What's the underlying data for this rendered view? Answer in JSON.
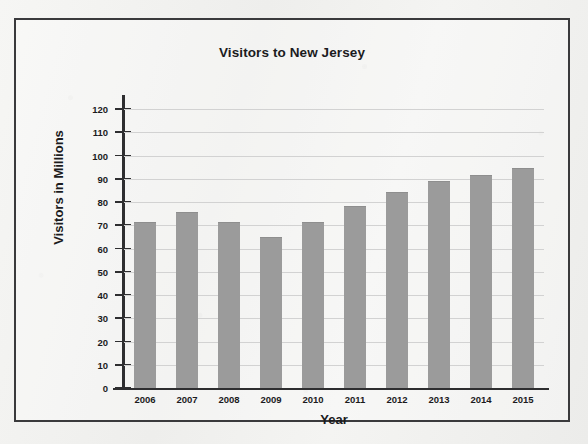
{
  "chart_data": {
    "type": "bar",
    "title": "Visitors to New Jersey",
    "xlabel": "Year",
    "ylabel": "Visitors in Millions",
    "categories": [
      "2006",
      "2007",
      "2008",
      "2009",
      "2010",
      "2011",
      "2012",
      "2013",
      "2014",
      "2015"
    ],
    "values": [
      71.5,
      75.5,
      71.5,
      65,
      71.5,
      78.5,
      84.5,
      89,
      91.5,
      94.5
    ],
    "ylim": [
      0,
      120
    ],
    "ytick_labels": [
      "0",
      "10",
      "20",
      "30",
      "40",
      "50",
      "60",
      "70",
      "80",
      "90",
      "100",
      "110",
      "120"
    ],
    "ytick_values": [
      0,
      10,
      20,
      30,
      40,
      50,
      60,
      70,
      80,
      90,
      100,
      110,
      120
    ],
    "grid": true,
    "legend": null,
    "bar_color": "#9b9b9b",
    "grid_color": "#d2d2d2",
    "axis_color": "#2e2e30",
    "frame_color": "#3a3a3c",
    "background_color": "#f2f2f0"
  }
}
